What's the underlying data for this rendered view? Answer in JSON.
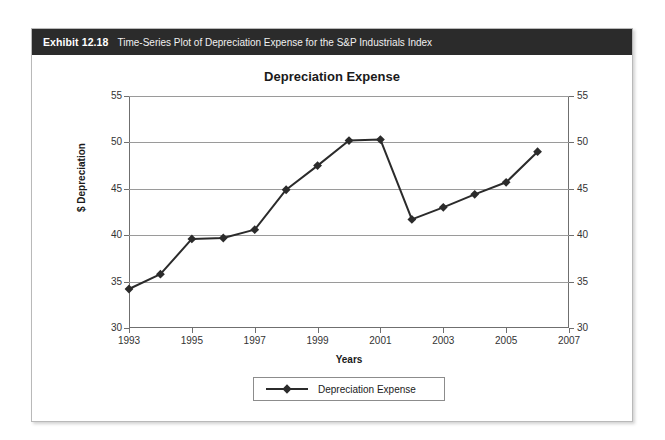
{
  "exhibit": {
    "label": "Exhibit 12.18",
    "caption": "Time-Series Plot of Depreciation Expense for the S&P Industrials Index"
  },
  "chart_data": {
    "type": "line",
    "title": "Depreciation Expense",
    "xlabel": "Years",
    "ylabel": "$ Depreciation",
    "xlim": [
      1993,
      2007
    ],
    "ylim": [
      30,
      55
    ],
    "yticks": [
      30,
      35,
      40,
      45,
      50,
      55
    ],
    "xticks": [
      1993,
      1995,
      1997,
      1999,
      2001,
      2003,
      2005,
      2007
    ],
    "grid": true,
    "dual_y_axis": true,
    "legend": "bottom-center",
    "marker": "diamond",
    "series": [
      {
        "name": "Depreciation Expense",
        "color": "#2b2b2b",
        "x": [
          1993,
          1994,
          1995,
          1996,
          1997,
          1998,
          1999,
          2000,
          2001,
          2002,
          2003,
          2004,
          2005,
          2006
        ],
        "values": [
          34.2,
          35.8,
          39.6,
          39.7,
          40.6,
          44.9,
          47.5,
          50.2,
          50.3,
          41.7,
          43.0,
          44.4,
          45.7,
          49.0
        ]
      }
    ]
  },
  "legend": {
    "entries": [
      {
        "label": "Depreciation Expense",
        "color": "#2b2b2b"
      }
    ]
  }
}
